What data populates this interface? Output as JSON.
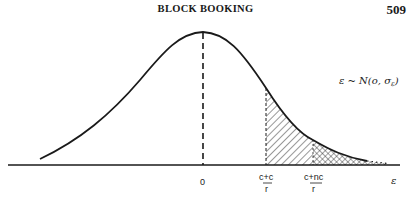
{
  "page": {
    "running_head": "BLOCK BOOKING",
    "page_number": "509"
  },
  "figure": {
    "distribution_label": "ε ~ N(o, σε)",
    "distribution_label_parts": {
      "lhs": "ε ~ N(o, σ",
      "sub": "ε",
      "close": ")"
    },
    "x_axis_symbol": "ε",
    "ticks": [
      {
        "label": "0"
      },
      {
        "numerator": "c+c",
        "denominator": "r"
      },
      {
        "numerator": "c+nc",
        "denominator": "r"
      }
    ],
    "regions": [
      {
        "name": "single-hatched tail",
        "from": "(c+c)/r",
        "pattern": "diagonal"
      },
      {
        "name": "cross-hatched tail",
        "from": "(c+nc)/r",
        "pattern": "cross"
      }
    ],
    "colors": {
      "ink": "#1a1a1a",
      "paper": "#ffffff"
    }
  }
}
